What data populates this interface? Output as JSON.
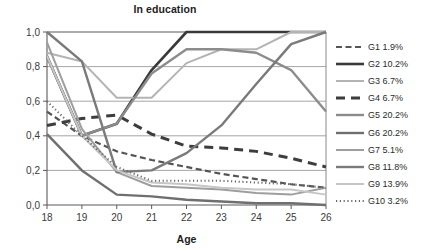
{
  "chart_data": {
    "type": "line",
    "title": "In education",
    "xlabel": "Age",
    "ylabel": "",
    "x": [
      18,
      19,
      20,
      21,
      22,
      23,
      24,
      25,
      26
    ],
    "xticklabels": [
      "18",
      "19",
      "20",
      "21",
      "22",
      "23",
      "24",
      "25",
      "26"
    ],
    "yticklabels": [
      "0,0",
      "0,2",
      "0,4",
      "0,6",
      "0,8",
      "1,0"
    ],
    "yticks": [
      0.0,
      0.2,
      0.4,
      0.6,
      0.8,
      1.0
    ],
    "ylim": [
      0.0,
      1.0
    ],
    "xlim": [
      18,
      26
    ],
    "grid": "horizontal",
    "legend_position": "right",
    "series": [
      {
        "name": "G1 1.9%",
        "label": "G1 1.9%",
        "style": "dashed",
        "color": "#555555",
        "width": 2.2,
        "dash": "6,3.5",
        "values": [
          0.54,
          0.4,
          0.31,
          0.26,
          0.22,
          0.18,
          0.15,
          0.12,
          0.1
        ]
      },
      {
        "name": "G2 10.2%",
        "label": "G2 10.2%",
        "style": "solid",
        "color": "#3a3a3a",
        "width": 2.6,
        "dash": "",
        "values": [
          0.86,
          0.4,
          0.47,
          0.78,
          1.0,
          1.0,
          1.0,
          1.0,
          1.0
        ]
      },
      {
        "name": "G3 6.7%",
        "label": "G3 6.7%",
        "style": "solid",
        "color": "#b4b4b4",
        "width": 2.0,
        "dash": "",
        "values": [
          0.88,
          0.83,
          0.62,
          0.62,
          0.82,
          0.9,
          0.9,
          1.0,
          1.0
        ]
      },
      {
        "name": "G4 6.7%",
        "label": "G4 6.7%",
        "style": "dashed",
        "color": "#3d3d3d",
        "width": 3.0,
        "dash": "9,6",
        "values": [
          0.46,
          0.5,
          0.52,
          0.41,
          0.34,
          0.33,
          0.31,
          0.27,
          0.22
        ]
      },
      {
        "name": "G5 20.2%",
        "label": "G5 20.2%",
        "style": "solid",
        "color": "#8c8c8c",
        "width": 2.4,
        "dash": "",
        "values": [
          0.86,
          0.4,
          0.47,
          0.76,
          0.9,
          0.9,
          0.88,
          0.78,
          0.54
        ]
      },
      {
        "name": "G6 20.2%",
        "label": "G6 20.2%",
        "style": "solid",
        "color": "#6f6f6f",
        "width": 2.4,
        "dash": "",
        "values": [
          0.41,
          0.2,
          0.06,
          0.05,
          0.03,
          0.02,
          0.01,
          0.01,
          0.0
        ]
      },
      {
        "name": "G7 5.1%",
        "label": "G7 5.1%",
        "style": "solid",
        "color": "#9e9e9e",
        "width": 2.0,
        "dash": "",
        "values": [
          0.94,
          0.44,
          0.19,
          0.11,
          0.1,
          0.09,
          0.07,
          0.06,
          0.1
        ]
      },
      {
        "name": "G8 11.8%",
        "label": "G8 11.8%",
        "style": "solid",
        "color": "#7a7a7a",
        "width": 2.4,
        "dash": "",
        "values": [
          1.0,
          0.83,
          0.19,
          0.2,
          0.3,
          0.46,
          0.7,
          0.93,
          1.0
        ]
      },
      {
        "name": "G9 13.9%",
        "label": "G9 13.9%",
        "style": "solid",
        "color": "#c6c6c6",
        "width": 2.0,
        "dash": "",
        "values": [
          0.86,
          0.4,
          0.2,
          0.13,
          0.12,
          0.1,
          0.09,
          0.09,
          0.06
        ]
      },
      {
        "name": "G10 3.2%",
        "label": "G10 3.2%",
        "style": "dotted",
        "color": "#6a6a6a",
        "width": 2.0,
        "dash": "1.2,2.6",
        "values": [
          0.6,
          0.4,
          0.22,
          0.14,
          0.14,
          0.14,
          0.13,
          0.12,
          0.1
        ]
      }
    ]
  }
}
